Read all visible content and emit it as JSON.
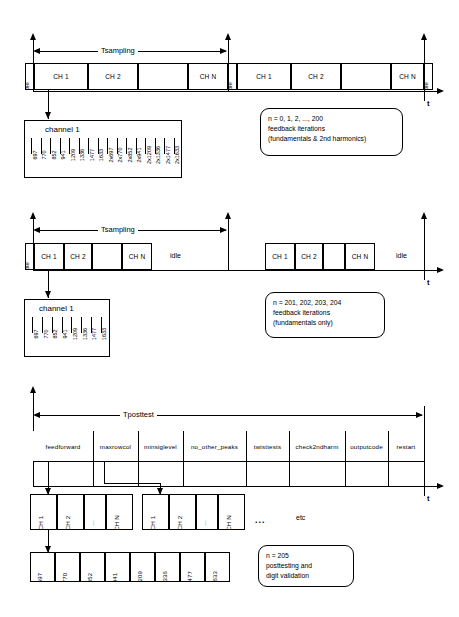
{
  "figure": {
    "axis_label": "t",
    "dots": "...",
    "etc": "etc",
    "idle_label": "idle",
    "channel_box_title": "channel 1"
  },
  "section1": {
    "span_label": "Tsampling",
    "axis_label": "t",
    "period1": [
      "idle",
      "CH 1",
      "CH 2",
      "",
      "CH N",
      "idle"
    ],
    "period2": [
      "CH 1",
      "CH 2",
      "",
      "CH N",
      "idle"
    ],
    "channel_box": {
      "title": "channel 1",
      "frequencies": [
        "697",
        "770",
        "852",
        "941",
        "1209",
        "1336",
        "1477",
        "1633",
        "2x697",
        "2x770",
        "2x852",
        "2x941",
        "2x1209",
        "2x1336",
        "2x1477",
        "2x1633"
      ]
    },
    "note": {
      "line1": "n = 0, 1, 2, ..., 200",
      "line2": "feedback iterations",
      "line3": "(fundamentals & 2nd harmonics)"
    }
  },
  "section2": {
    "span_label": "Tsampling",
    "axis_label": "t",
    "period1": [
      "idle",
      "CH 1",
      "CH 2",
      "",
      "CH N"
    ],
    "idle_span1": "idle",
    "period2": [
      "CH 1",
      "CH 2",
      "",
      "CH N"
    ],
    "idle_span2": "idle",
    "channel_box": {
      "title": "channel 1",
      "frequencies": [
        "697",
        "770",
        "852",
        "941",
        "1209",
        "1336",
        "1477",
        "1633"
      ]
    },
    "note": {
      "line1": "n = 201, 202, 203, 204",
      "line2": "feedback iterations",
      "line3": "(fundamentals only)"
    }
  },
  "section3": {
    "span_label": "Tposttest",
    "axis_label": "t",
    "stages": [
      "feedforward",
      "maxrowcol",
      "minsiglevel",
      "no_other_peaks",
      "twisttests",
      "check2ndharm",
      "outputcode",
      "restart"
    ],
    "channel_group1": [
      "CH 1",
      "CH 2",
      "...",
      "CH N"
    ],
    "channel_group2": [
      "CH 1",
      "CH 2",
      "...",
      "CH N"
    ],
    "ellipsis": "...",
    "etc": "etc",
    "freq_row": [
      "697",
      "770",
      "852",
      "941",
      "1209",
      "1336",
      "1477",
      "1633"
    ],
    "note": {
      "line1": "n = 205",
      "line2": "posttesting and",
      "line3": "digit validation"
    }
  }
}
